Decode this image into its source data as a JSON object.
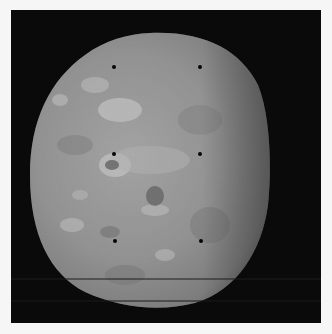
{
  "image": {
    "subject": "Grayscale photograph of a cratered moon against black space",
    "alt": "Moon surface with bright ray patches and dark crater floors, with reseau calibration marks",
    "colors": {
      "page_background": "#f6f6f6",
      "space": "#0a0a0a",
      "surface_mid": "#8c8c8c",
      "surface_bright": "#d8d8d8",
      "surface_dark": "#5a5a5a",
      "reseau_mark": "#050505"
    },
    "reseau_marks": [
      {
        "x": 114,
        "y": 67
      },
      {
        "x": 200,
        "y": 67
      },
      {
        "x": 114,
        "y": 154
      },
      {
        "x": 200,
        "y": 154
      },
      {
        "x": 115,
        "y": 241
      },
      {
        "x": 201,
        "y": 241
      }
    ]
  }
}
